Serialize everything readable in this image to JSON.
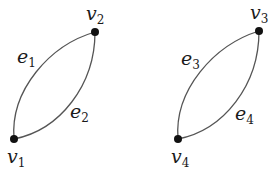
{
  "diagram": {
    "type": "graph",
    "components": [
      {
        "name": "component-1",
        "vertices": [
          {
            "id": "v1",
            "base": "v",
            "sub": "1",
            "x": 14,
            "y": 139,
            "label_x": 7,
            "label_y": 163
          },
          {
            "id": "v2",
            "base": "v",
            "sub": "2",
            "x": 95,
            "y": 32,
            "label_x": 86,
            "label_y": 20
          }
        ],
        "edges": [
          {
            "id": "e1",
            "base": "e",
            "sub": "1",
            "from": "v1",
            "to": "v2",
            "label_x": 17,
            "label_y": 63
          },
          {
            "id": "e2",
            "base": "e",
            "sub": "2",
            "from": "v1",
            "to": "v2",
            "label_x": 70,
            "label_y": 118
          }
        ]
      },
      {
        "name": "component-2",
        "vertices": [
          {
            "id": "v3",
            "base": "v",
            "sub": "3",
            "x": 259,
            "y": 31,
            "label_x": 250,
            "label_y": 19
          },
          {
            "id": "v4",
            "base": "v",
            "sub": "4",
            "x": 178,
            "y": 139,
            "label_x": 171,
            "label_y": 163
          }
        ],
        "edges": [
          {
            "id": "e3",
            "base": "e",
            "sub": "3",
            "from": "v4",
            "to": "v3",
            "label_x": 181,
            "label_y": 65
          },
          {
            "id": "e4",
            "base": "e",
            "sub": "4",
            "from": "v4",
            "to": "v3",
            "label_x": 235,
            "label_y": 120
          }
        ]
      }
    ],
    "colors": {
      "edge": "#555555",
      "vertex": "#111111",
      "text": "#1a1a1a"
    }
  }
}
